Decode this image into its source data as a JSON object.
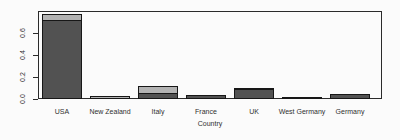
{
  "chart_data": {
    "type": "bar",
    "stacked": true,
    "title": "",
    "xlabel": "Country",
    "ylabel": "",
    "categories": [
      "USA",
      "New Zealand",
      "Italy",
      "France",
      "UK",
      "West Germany",
      "Germany"
    ],
    "series": [
      {
        "name": "dark-segment",
        "color": "#525252",
        "values": [
          0.72,
          0,
          0.052,
          0.034,
          0.095,
          0,
          0.044
        ]
      },
      {
        "name": "light-segment",
        "color": "#b3b3b3",
        "values": [
          0.065,
          0.025,
          0.075,
          0,
          0.012,
          0.021,
          0
        ]
      }
    ],
    "ylim": [
      0,
      0.8
    ],
    "yticks": [
      0,
      0.2,
      0.4,
      0.6
    ],
    "ytick_labels": [
      "0.0",
      "0.2",
      "0.4",
      "0.6"
    ],
    "grid": false,
    "legend": "none",
    "frame": true
  },
  "colors": {
    "background": "#fbfbfb",
    "frame_border": "#2b2b2b",
    "bar_border": "#171717",
    "text": "#303030"
  }
}
